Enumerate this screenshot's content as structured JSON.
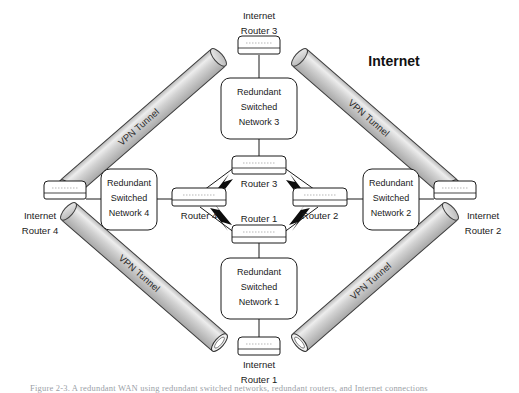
{
  "figure": {
    "title_label": "Internet",
    "caption": "Figure 2-3. A redundant WAN using redundant switched networks, redundant routers, and Internet connections"
  },
  "tunnels": [
    {
      "id": "tunnel-top-left",
      "label": "VPN Tunnel"
    },
    {
      "id": "tunnel-top-right",
      "label": "VPN Tunnel"
    },
    {
      "id": "tunnel-bottom-left",
      "label": "VPN Tunnel"
    },
    {
      "id": "tunnel-bottom-right",
      "label": "VPN Tunnel"
    }
  ],
  "internet_routers": [
    {
      "id": "internet-router-3",
      "line1": "Internet",
      "line2": "Router 3",
      "position": "top"
    },
    {
      "id": "internet-router-4",
      "line1": "Internet",
      "line2": "Router 4",
      "position": "left"
    },
    {
      "id": "internet-router-2",
      "line1": "Internet",
      "line2": "Router 2",
      "position": "right"
    },
    {
      "id": "internet-router-1",
      "line1": "Internet",
      "line2": "Router 1",
      "position": "bottom"
    }
  ],
  "switched_networks": [
    {
      "id": "rsn-3",
      "line1": "Redundant",
      "line2": "Switched",
      "line3": "Network 3",
      "position": "top"
    },
    {
      "id": "rsn-4",
      "line1": "Redundant",
      "line2": "Switched",
      "line3": "Network 4",
      "position": "left"
    },
    {
      "id": "rsn-2",
      "line1": "Redundant",
      "line2": "Switched",
      "line3": "Network 2",
      "position": "right"
    },
    {
      "id": "rsn-1",
      "line1": "Redundant",
      "line2": "Switched",
      "line3": "Network 1",
      "position": "bottom"
    }
  ],
  "core_routers": [
    {
      "id": "router-3",
      "label": "Router 3",
      "position": "top"
    },
    {
      "id": "router-4",
      "label": "Router 4",
      "position": "left"
    },
    {
      "id": "router-2",
      "label": "Router 2",
      "position": "right"
    },
    {
      "id": "router-1",
      "label": "Router 1",
      "position": "bottom"
    }
  ],
  "links": [
    {
      "id": "link-router4-router3",
      "type": "lightning"
    },
    {
      "id": "link-router3-router2",
      "type": "lightning"
    },
    {
      "id": "link-router4-router1",
      "type": "lightning"
    },
    {
      "id": "link-router1-router2",
      "type": "lightning"
    }
  ],
  "colors": {
    "tunnel_fill": "#c9c9c9",
    "tunnel_highlight": "#e8e8e8",
    "tunnel_edge": "#4a4a4a",
    "stroke": "#1a1a1a",
    "background": "#ffffff",
    "caption": "#9aa0a6"
  }
}
